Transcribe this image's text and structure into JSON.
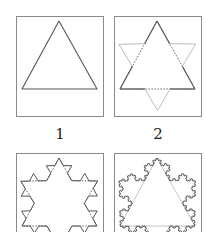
{
  "colors": {
    "frame": "#8a8a8a",
    "curve": "#555555",
    "faded": "#bdbdbd"
  },
  "panels": [
    {
      "label": "1",
      "iteration": 0
    },
    {
      "label": "2",
      "iteration": 1
    },
    {
      "label": "3",
      "iteration": 2
    },
    {
      "label": "4",
      "iteration": 4
    }
  ]
}
